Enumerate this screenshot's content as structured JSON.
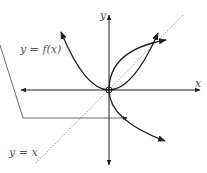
{
  "diagram": {
    "type": "function and inverse reflection",
    "labels": {
      "y_axis": "y",
      "x_axis": "x",
      "function": "y = f(x)",
      "identity_line": "y = x"
    },
    "elements": [
      {
        "name": "x-axis",
        "kind": "double-arrow line"
      },
      {
        "name": "y-axis",
        "kind": "double-arrow line"
      },
      {
        "name": "parabola",
        "kind": "curve",
        "equation": "y = x^2"
      },
      {
        "name": "inverse-curve",
        "kind": "curve",
        "equation": "x = y^2"
      },
      {
        "name": "identity-line",
        "kind": "dotted line",
        "equation": "y = x"
      },
      {
        "name": "callout",
        "kind": "leader arrow pointing to inverse branch"
      }
    ],
    "colors": {
      "stroke": "#222222",
      "label": "#555555",
      "dotted": "#888888"
    }
  }
}
